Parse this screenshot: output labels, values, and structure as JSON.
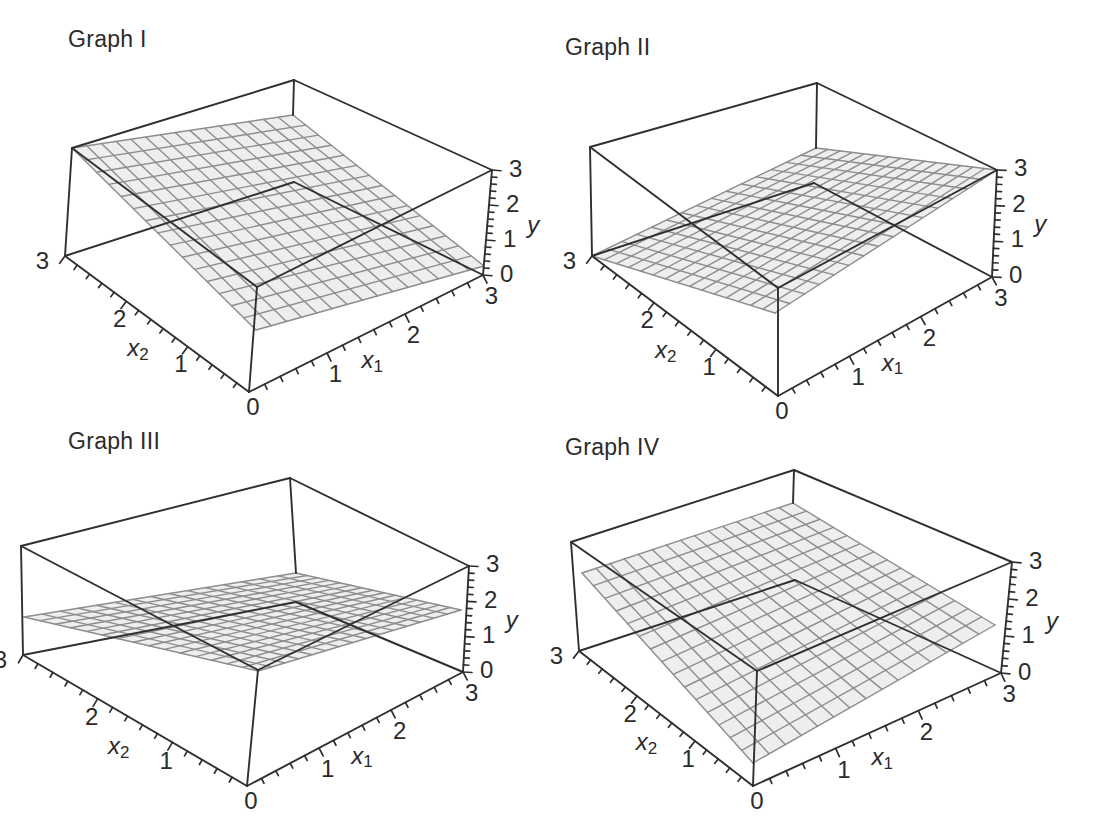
{
  "figure": {
    "kind": "textbook 3D regression-surface figure",
    "background": "#ffffff"
  },
  "styles": {
    "box_line_color": "#2f2f2f",
    "box_line_width": 1.9,
    "mesh_fill": "#eaeaea",
    "mesh_fill_opacity": 0.82,
    "mesh_line_color": "#8d8d8d",
    "mesh_line_width": 1.4,
    "tick_width": 1.7,
    "label_color": "#2b2b2b",
    "tick_font_size": 24,
    "axis_letter_font_size": 24,
    "axis_sub_font_size": 17,
    "title_font_size": 23
  },
  "chart_data": [
    {
      "id": "I",
      "title": "Graph I",
      "type": "surface",
      "axes": {
        "x1": {
          "letter": "x",
          "sub": "1"
        },
        "x2": {
          "letter": "x",
          "sub": "2"
        },
        "y": {
          "letter": "y",
          "sub": ""
        }
      },
      "domain": {
        "x1": [
          0,
          3
        ],
        "x2": [
          0,
          3
        ],
        "y": [
          0,
          3
        ]
      },
      "tick_labels": {
        "x1": [
          "1",
          "2",
          "3"
        ],
        "x2": [
          "1",
          "2",
          "3"
        ],
        "y": [
          "0",
          "1",
          "2",
          "3"
        ],
        "origin": "0"
      },
      "minor_tick_step": 0.2,
      "mesh_divisions": 15,
      "surface": {
        "description": "plane high at x2=3 corner, low at x1=3 corner",
        "corner_heights": {
          "x1_0_x2_0": 1.8,
          "x1_3_x2_0": 0.3,
          "x1_3_x2_3": 2.0,
          "x1_0_x2_3": 3.0
        }
      },
      "proj": {
        "O": [
          249,
          392
        ],
        "R0": [
          483,
          275
        ],
        "L0": [
          65,
          256
        ],
        "B0": [
          294,
          182
        ],
        "TF": [
          257,
          287
        ],
        "TR": [
          492,
          170
        ],
        "TL": [
          72,
          148
        ],
        "TB": [
          294,
          80
        ],
        "mesh": {
          "F": [
            256,
            330
          ],
          "R": [
            484,
            266
          ],
          "B": [
            293,
            115
          ],
          "L": [
            72,
            148
          ]
        },
        "title_pos": [
          68,
          26
        ]
      }
    },
    {
      "id": "II",
      "title": "Graph II",
      "type": "surface",
      "axes": {
        "x1": {
          "letter": "x",
          "sub": "1"
        },
        "x2": {
          "letter": "x",
          "sub": "2"
        },
        "y": {
          "letter": "y",
          "sub": ""
        }
      },
      "domain": {
        "x1": [
          0,
          3
        ],
        "x2": [
          0,
          3
        ],
        "y": [
          0,
          3
        ]
      },
      "tick_labels": {
        "x1": [
          "1",
          "2",
          "3"
        ],
        "x2": [
          "1",
          "2",
          "3"
        ],
        "y": [
          "0",
          "1",
          "2",
          "3"
        ],
        "origin": "0"
      },
      "minor_tick_step": 0.2,
      "mesh_divisions": 15,
      "surface": {
        "description": "plane high at x1=3 corner, low at x2=3 corner",
        "corner_heights": {
          "x1_0_x2_0": 2.3,
          "x1_3_x2_0": 3.0,
          "x1_3_x2_3": 1.0,
          "x1_0_x2_3": 0.0
        }
      },
      "proj": {
        "O": [
          778,
          396
        ],
        "R0": [
          992,
          277
        ],
        "L0": [
          592,
          256
        ],
        "B0": [
          814,
          183
        ],
        "TF": [
          778,
          288
        ],
        "TR": [
          997,
          170
        ],
        "TL": [
          590,
          147
        ],
        "TB": [
          817,
          83
        ],
        "mesh": {
          "F": [
            775,
            313
          ],
          "R": [
            997,
            170
          ],
          "B": [
            816,
            148
          ],
          "L": [
            592,
            256
          ]
        },
        "title_pos": [
          565,
          34
        ]
      }
    },
    {
      "id": "III",
      "title": "Graph III",
      "type": "surface",
      "surface_note": "appears as a nearly flat low band across the box",
      "axes": {
        "x1": {
          "letter": "x",
          "sub": "1"
        },
        "x2": {
          "letter": "x",
          "sub": "2"
        },
        "y": {
          "letter": "y",
          "sub": ""
        }
      },
      "domain": {
        "x1": [
          0,
          3
        ],
        "x2": [
          0,
          3
        ],
        "y": [
          0,
          3
        ]
      },
      "tick_labels": {
        "x1": [
          "1",
          "2",
          "3"
        ],
        "x2": [
          "1",
          "2",
          "3"
        ],
        "y": [
          "0",
          "1",
          "2",
          "3"
        ],
        "origin": "0"
      },
      "minor_tick_step": 0.2,
      "mesh_divisions": 15,
      "surface": {
        "description": "shallow plane, mid-height band across box",
        "corner_heights": {
          "x1_0_x2_0": 2.9,
          "x1_3_x2_0": 1.7,
          "x1_3_x2_3": 0.7,
          "x1_0_x2_3": 1.1
        }
      },
      "proj": {
        "O": [
          247,
          786
        ],
        "R0": [
          463,
          672
        ],
        "L0": [
          23,
          655
        ],
        "B0": [
          296,
          602
        ],
        "TF": [
          258,
          670
        ],
        "TR": [
          469,
          566
        ],
        "TL": [
          21,
          546
        ],
        "TB": [
          290,
          478
        ],
        "mesh": {
          "F": [
            258,
            671
          ],
          "R": [
            461,
            610
          ],
          "B": [
            296,
            573
          ],
          "L": [
            24,
            617
          ]
        },
        "title_pos": [
          68,
          428
        ]
      }
    },
    {
      "id": "IV",
      "title": "Graph IV",
      "type": "surface",
      "axes": {
        "x1": {
          "letter": "x",
          "sub": "1"
        },
        "x2": {
          "letter": "x",
          "sub": "2"
        },
        "y": {
          "letter": "y",
          "sub": ""
        }
      },
      "domain": {
        "x1": [
          0,
          3
        ],
        "x2": [
          0,
          3
        ],
        "y": [
          0,
          3
        ]
      },
      "tick_labels": {
        "x1": [
          "1",
          "2",
          "3"
        ],
        "x2": [
          "1",
          "2",
          "3"
        ],
        "y": [
          "0",
          "1",
          "2",
          "3"
        ],
        "origin": "0"
      },
      "minor_tick_step": 0.2,
      "mesh_divisions": 15,
      "surface": {
        "description": "plane rising from front corner toward back, moderate in both x1 and x2",
        "corner_heights": {
          "x1_0_x2_0": 0.6,
          "x1_3_x2_0": 1.3,
          "x1_3_x2_3": 2.1,
          "x1_0_x2_3": 2.2
        }
      },
      "proj": {
        "O": [
          753,
          786
        ],
        "R0": [
          1001,
          673
        ],
        "L0": [
          579,
          651
        ],
        "B0": [
          795,
          580
        ],
        "TF": [
          757,
          671
        ],
        "TR": [
          1012,
          562
        ],
        "TL": [
          571,
          542
        ],
        "TB": [
          794,
          470
        ],
        "mesh": {
          "F": [
            753,
            763
          ],
          "R": [
            995,
            625
          ],
          "B": [
            793,
            503
          ],
          "L": [
            582,
            573
          ]
        },
        "title_pos": [
          565,
          434
        ]
      }
    }
  ]
}
